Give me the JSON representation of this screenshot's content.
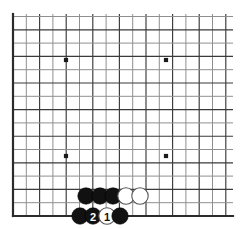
{
  "figure": {
    "kind": "go-board-diagram",
    "background_color": "#ffffff",
    "width": 240,
    "height": 229
  },
  "board": {
    "line_color": "#8f8f8f",
    "strong_line_color": "#3a3a3a",
    "edge_color": "#2b2b2b",
    "star_point_color": "#1a1a1a",
    "spacing": 13.3,
    "origin_x": 13,
    "origin_y": 216,
    "columns": 17,
    "rows": 16,
    "left_edge_x": 13,
    "bottom_edge_y": 216,
    "right_extent_x": 233,
    "top_extent_y": 14,
    "star_points": [
      {
        "name": "star-top-left",
        "x": 66,
        "y": 60
      },
      {
        "name": "star-top-right",
        "x": 166,
        "y": 60
      },
      {
        "name": "star-bottom-left",
        "x": 66,
        "y": 156
      },
      {
        "name": "star-bottom-right",
        "x": 166,
        "y": 156
      }
    ],
    "star_radius": 2.1
  },
  "stones": {
    "radius": 8.2,
    "items": [
      {
        "name": "stone-black-a",
        "color": "black",
        "x": 86,
        "y": 196,
        "label": ""
      },
      {
        "name": "stone-black-b",
        "color": "black",
        "x": 100,
        "y": 196,
        "label": ""
      },
      {
        "name": "stone-black-c",
        "color": "black",
        "x": 113,
        "y": 196,
        "label": ""
      },
      {
        "name": "stone-white-d",
        "color": "white",
        "x": 126,
        "y": 196,
        "label": ""
      },
      {
        "name": "stone-white-e",
        "color": "white",
        "x": 140,
        "y": 196,
        "label": ""
      },
      {
        "name": "stone-black-f",
        "color": "black",
        "x": 80,
        "y": 216,
        "label": ""
      },
      {
        "name": "stone-black-move-2",
        "color": "black",
        "x": 93,
        "y": 216,
        "label": "2"
      },
      {
        "name": "stone-white-move-1",
        "color": "white",
        "x": 107,
        "y": 216,
        "label": "1"
      },
      {
        "name": "stone-black-g",
        "color": "black",
        "x": 120,
        "y": 216,
        "label": ""
      }
    ]
  },
  "move_numbers": {
    "white_move": "1",
    "black_move": "2"
  }
}
